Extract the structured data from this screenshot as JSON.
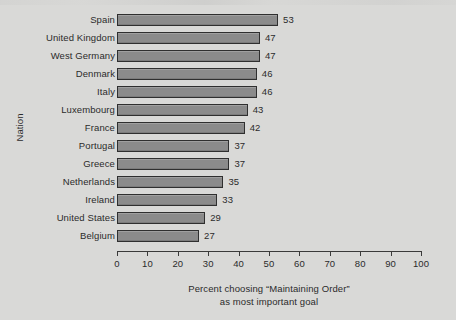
{
  "chart_data": {
    "type": "bar",
    "orientation": "horizontal",
    "title": "",
    "xlabel_line1": "Percent choosing “Maintaining Order”",
    "xlabel_line2": "as most important goal",
    "ylabel": "Nation",
    "categories": [
      "Spain",
      "United Kingdom",
      "West Germany",
      "Denmark",
      "Italy",
      "Luxembourg",
      "France",
      "Portugal",
      "Greece",
      "Netherlands",
      "Ireland",
      "United States",
      "Belgium"
    ],
    "values": [
      53,
      47,
      47,
      46,
      46,
      43,
      42,
      37,
      37,
      35,
      33,
      29,
      27
    ],
    "value_labels": [
      "53",
      "47",
      "47",
      "46",
      "46",
      "43",
      "42",
      "37",
      "37",
      "35",
      "33",
      "29",
      "27"
    ],
    "xlim": [
      0,
      100
    ],
    "xticks": [
      0,
      10,
      20,
      30,
      40,
      50,
      60,
      70,
      80,
      90,
      100
    ],
    "xtick_labels": [
      "0",
      "10",
      "20",
      "30",
      "40",
      "50",
      "60",
      "70",
      "80",
      "90",
      "100"
    ],
    "grid": false,
    "legend": null,
    "bar_color": "#8b8b8b",
    "bar_edge_color": "#2f2f2f",
    "background_color": "#d9d9d7",
    "text_color": "#2b2b2b",
    "axis_color": "#3a3a3a"
  }
}
